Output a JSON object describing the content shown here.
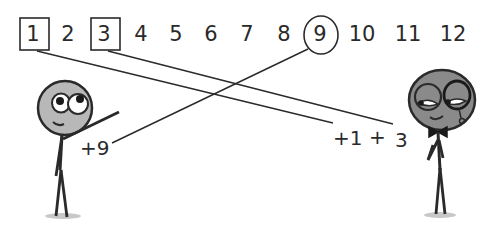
{
  "numbers": [
    {
      "value": "1",
      "x": 33,
      "marker": "box"
    },
    {
      "value": "2",
      "x": 68,
      "marker": "none"
    },
    {
      "value": "3",
      "x": 104,
      "marker": "box"
    },
    {
      "value": "4",
      "x": 141,
      "marker": "none"
    },
    {
      "value": "5",
      "x": 176,
      "marker": "none"
    },
    {
      "value": "6",
      "x": 211,
      "marker": "none"
    },
    {
      "value": "7",
      "x": 247,
      "marker": "none"
    },
    {
      "value": "8",
      "x": 284,
      "marker": "none"
    },
    {
      "value": "9",
      "x": 320,
      "marker": "circle"
    },
    {
      "value": "10",
      "x": 362,
      "marker": "none"
    },
    {
      "value": "11",
      "x": 408,
      "marker": "none"
    },
    {
      "value": "12",
      "x": 453,
      "marker": "none"
    }
  ],
  "labels": {
    "left_character": "+9",
    "right_character_a": "+1",
    "plus": "+",
    "right_character_b": "3"
  },
  "colors": {
    "ink": "#2a2a2a",
    "head_fill_left": "#b8b8b8",
    "head_fill_right": "#8a8a8a",
    "ground": "#c8c8c8"
  }
}
